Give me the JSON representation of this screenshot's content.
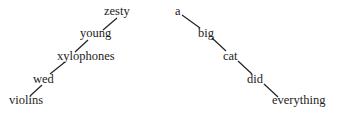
{
  "left_tree": {
    "words": [
      "zesty",
      "young",
      "xylophones",
      "wed",
      "violins"
    ]
  },
  "right_tree": {
    "words": [
      "a",
      "big",
      "cat",
      "did",
      "everything"
    ]
  }
}
